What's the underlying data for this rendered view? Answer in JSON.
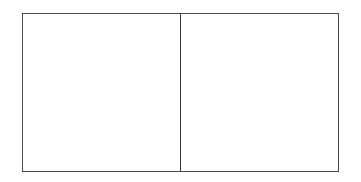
{
  "diagram": {
    "type": "two-panel-box",
    "panels": [
      {
        "id": "left",
        "label": ""
      },
      {
        "id": "right",
        "label": ""
      }
    ],
    "colors": {
      "border": "#4a4a4a",
      "background": "#ffffff"
    }
  }
}
